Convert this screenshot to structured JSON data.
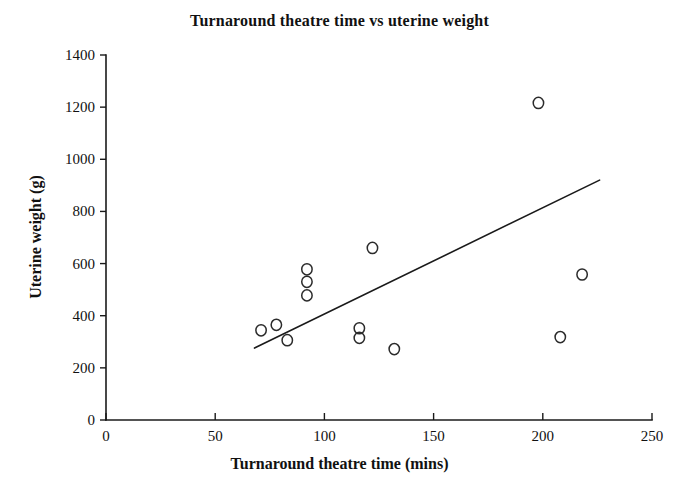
{
  "chart_data": {
    "type": "scatter",
    "title": "Turnaround theatre time vs uterine weight",
    "xlabel": "Turnaround theatre time (mins)",
    "ylabel": "Uterine weight (g)",
    "xlim": [
      0,
      250
    ],
    "ylim": [
      0,
      1400
    ],
    "xticks": [
      0,
      50,
      100,
      150,
      200,
      250
    ],
    "yticks": [
      0,
      200,
      400,
      600,
      800,
      1000,
      1200,
      1400
    ],
    "xtick_labels": [
      "0",
      "50",
      "100",
      "150",
      "200",
      "250"
    ],
    "ytick_labels": [
      "0",
      "200",
      "400",
      "600",
      "800",
      "1000",
      "1200",
      "1400"
    ],
    "grid": false,
    "legend": false,
    "marker": "open-circle",
    "marker_color": "#2b2b2b",
    "series": [
      {
        "name": "patients",
        "points": [
          {
            "x": 71,
            "y": 344
          },
          {
            "x": 78,
            "y": 365
          },
          {
            "x": 83,
            "y": 306
          },
          {
            "x": 92,
            "y": 578
          },
          {
            "x": 92,
            "y": 530
          },
          {
            "x": 92,
            "y": 478
          },
          {
            "x": 122,
            "y": 660
          },
          {
            "x": 116,
            "y": 352
          },
          {
            "x": 116,
            "y": 315
          },
          {
            "x": 132,
            "y": 272
          },
          {
            "x": 198,
            "y": 1216
          },
          {
            "x": 208,
            "y": 318
          },
          {
            "x": 218,
            "y": 558
          }
        ]
      }
    ],
    "trend_line": {
      "name": "regression line",
      "x_start": 68,
      "y_start": 276,
      "x_end": 226,
      "y_end": 920,
      "color": "#1a1a1a"
    }
  }
}
